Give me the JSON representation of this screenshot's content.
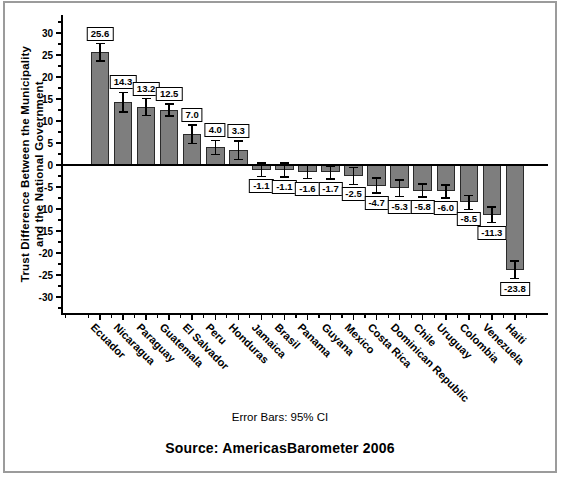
{
  "chart_data": {
    "type": "bar",
    "title": "",
    "categories": [
      "Ecuador",
      "Nicaragua",
      "Paraguay",
      "Guatemala",
      "El Salvador",
      "Peru",
      "Honduras",
      "Jamaica",
      "Brasil",
      "Panama",
      "Guyana",
      "Mexico",
      "Costa Rica",
      "Dominican Republic",
      "Chile",
      "Uruguay",
      "Colombia",
      "Venezuela",
      "Haiti"
    ],
    "values": [
      25.6,
      14.3,
      13.2,
      12.5,
      7.0,
      4.0,
      3.3,
      -1.1,
      -1.1,
      -1.6,
      -1.7,
      -2.5,
      -4.7,
      -5.3,
      -5.8,
      -6.0,
      -8.5,
      -11.3,
      -23.8
    ],
    "ci95_half_width_est": [
      2.0,
      2.2,
      1.9,
      1.4,
      2.1,
      1.6,
      2.1,
      1.5,
      1.6,
      1.5,
      1.5,
      1.9,
      1.7,
      1.9,
      1.5,
      1.5,
      1.6,
      1.8,
      2.0
    ],
    "ylabel_lines": [
      "Trust Difference Between the Municipality",
      "and the National Government"
    ],
    "xlabel": "",
    "y_ticks": [
      30,
      25,
      20,
      15,
      10,
      5,
      0,
      -5,
      -10,
      -15,
      -20,
      -25,
      -30
    ],
    "ylim": [
      -34,
      34
    ],
    "grid": false,
    "legend": "none",
    "bar_color": "#7e7e7e",
    "bar_border_color": "#2a2a2a",
    "error_bar_color": "#000000",
    "axis_color": "#000000",
    "value_label_box": {
      "bg": "#ffffff",
      "border": "#000000"
    }
  },
  "footer": {
    "error_bars_note": "Error Bars: 95% CI",
    "source": "Source: AmericasBarometer 2006"
  },
  "figure": {
    "border_color": "#9b9b9b",
    "background": "#ffffff"
  }
}
